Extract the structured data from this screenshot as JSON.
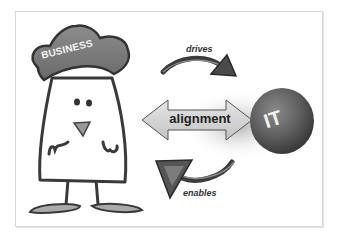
{
  "diagram": {
    "nodes": {
      "business": {
        "label": "BUSINESS",
        "shape": "cartoon-character-with-hat"
      },
      "it": {
        "label": "IT",
        "shape": "sphere"
      }
    },
    "connector": {
      "label": "alignment",
      "type": "double-headed-arrow"
    },
    "flows": [
      {
        "label": "drives",
        "from": "business",
        "to": "it",
        "icon": "curved-arrow-icon"
      },
      {
        "label": "enables",
        "from": "it",
        "to": "business",
        "icon": "curved-arrow-icon"
      }
    ]
  },
  "colors": {
    "hat": "#7a7a7a",
    "sphere": "#5a5a5a",
    "arrow_fill": "#d4d4d4",
    "outline": "#333333",
    "card_border": "#d6d6d6"
  }
}
